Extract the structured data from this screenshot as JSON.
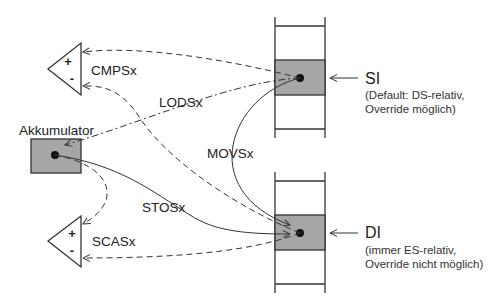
{
  "diagram": {
    "type": "string-instruction data flow",
    "nodes": {
      "accumulator": {
        "label": "Akkumulator"
      },
      "compare_top": {
        "plus": "+",
        "minus": "-"
      },
      "compare_bottom": {
        "plus": "+",
        "minus": "-"
      },
      "si": {
        "label": "SI",
        "note_line1": "(Default: DS-relativ,",
        "note_line2": "Override möglich)"
      },
      "di": {
        "label": "DI",
        "note_line1": "(immer ES-relativ,",
        "note_line2": "Override nicht möglich)"
      }
    },
    "edges": {
      "cmps": "CMPSx",
      "lods": "LODSx",
      "movs": "MOVSx",
      "stos": "STOSx",
      "scas": "SCASx"
    },
    "colors": {
      "box_fill": "#a6a6a6",
      "line": "#333333"
    }
  }
}
